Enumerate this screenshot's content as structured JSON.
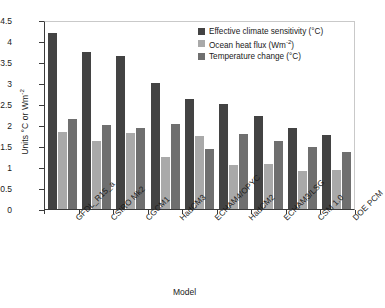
{
  "chart_data": {
    "type": "bar",
    "title": "",
    "xlabel": "Model",
    "ylabel": "Units °C or Wm-2",
    "ylim": [
      0,
      4.5
    ],
    "ystep": 0.5,
    "grid": false,
    "legend_position": "top-right",
    "ytick_labels": [
      "4.5",
      "4",
      "3.5",
      "3",
      "2.5",
      "2",
      "1.5",
      "1",
      "0.5",
      "0"
    ],
    "categories": [
      "GFDL_R15_a",
      "CSIRO Mk2",
      "CGCM1",
      "HadCM3",
      "ECHAM4/OPYC",
      "HadCM2",
      "ECHAM3/LSG",
      "CSM 1.0",
      "DOE PCM"
    ],
    "series": [
      {
        "name": "Effective climate sensitivity (°C)",
        "color": "#434343",
        "values": [
          4.2,
          3.73,
          3.64,
          3.01,
          2.62,
          2.5,
          2.22,
          1.92,
          1.77
        ]
      },
      {
        "name": "Ocean heat flux (Wm-2)",
        "color": "#a9a9a9",
        "values": [
          1.83,
          1.63,
          1.81,
          1.25,
          1.75,
          1.04,
          1.08,
          0.91,
          0.93
        ]
      },
      {
        "name": "Temperature change (°C)",
        "color": "#6f6f6f",
        "values": [
          2.15,
          2.01,
          1.94,
          2.03,
          1.43,
          1.78,
          1.61,
          1.47,
          1.35
        ]
      }
    ]
  },
  "axis": {
    "y_title_main": "Units °C or Wm",
    "y_title_sup": "-2",
    "x_title": "Model"
  },
  "legend": {
    "items": [
      {
        "label_main": "Effective climate sensitivity (°C)",
        "label_sup": ""
      },
      {
        "label_main": "Ocean heat flux (Wm",
        "label_sup": "-2",
        "label_tail": ")"
      },
      {
        "label_main": "Temperature change (°C)",
        "label_sup": ""
      }
    ]
  }
}
